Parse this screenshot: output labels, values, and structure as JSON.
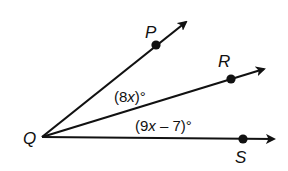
{
  "diagram": {
    "vertex": {
      "label": "Q"
    },
    "rays": [
      {
        "id": "QP",
        "point_label": "P"
      },
      {
        "id": "QR",
        "point_label": "R"
      },
      {
        "id": "QS",
        "point_label": "S"
      }
    ],
    "angles": [
      {
        "id": "PQR",
        "between": [
          "QP",
          "QR"
        ],
        "prefix": "(8",
        "var": "x",
        "suffix": ")°",
        "full": "(8x)°"
      },
      {
        "id": "RQS",
        "between": [
          "QR",
          "QS"
        ],
        "prefix": "(9",
        "var": "x",
        "suffix": " – 7)°",
        "full": "(9x – 7)°"
      }
    ],
    "colors": {
      "stroke": "#111111",
      "background": "#ffffff"
    }
  }
}
